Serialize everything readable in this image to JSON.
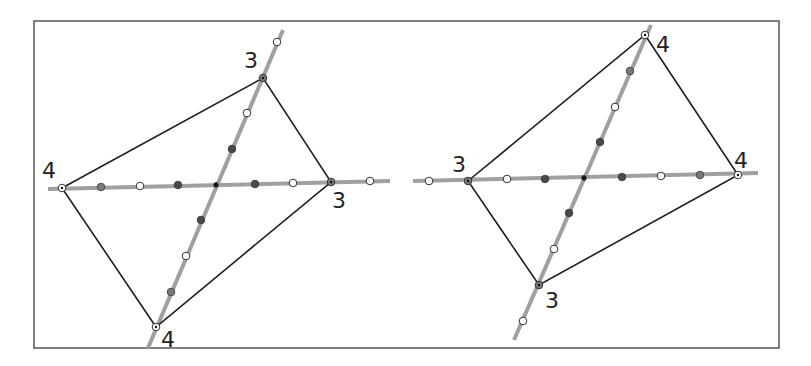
{
  "frame": {
    "x": 34,
    "y": 21,
    "width": 745,
    "height": 327,
    "stroke": "#555555"
  },
  "colors": {
    "axis_line": "#a0a0a0",
    "edge": "#1e1e1e",
    "dot_dark": "#4a4a4a",
    "dot_mid": "#7a7a7a",
    "dot_white": "#ffffff",
    "dot_center": "#111111",
    "dot_stroke": "#333333"
  },
  "figures": [
    {
      "name": "left-figure",
      "axes": [
        {
          "x1": 48,
          "y1": 189,
          "x2": 390,
          "y2": 181
        },
        {
          "x1": 148,
          "y1": 348,
          "x2": 283,
          "y2": 30
        }
      ],
      "quad": [
        [
          62,
          188
        ],
        [
          263,
          78
        ],
        [
          331,
          182
        ],
        [
          156,
          327
        ]
      ],
      "vertices": [
        {
          "x": 62,
          "y": 188,
          "label": "4",
          "lx": 42,
          "ly": 178,
          "type": "ring"
        },
        {
          "x": 263,
          "y": 78,
          "label": "3",
          "lx": 244,
          "ly": 68,
          "type": "dark"
        },
        {
          "x": 331,
          "y": 182,
          "label": "3",
          "lx": 332,
          "ly": 208,
          "type": "dark"
        },
        {
          "x": 156,
          "y": 327,
          "label": "4",
          "lx": 161,
          "ly": 347,
          "type": "ring"
        }
      ],
      "dots": [
        {
          "x": 101,
          "y": 187,
          "type": "mid"
        },
        {
          "x": 140,
          "y": 186,
          "type": "white"
        },
        {
          "x": 178,
          "y": 185,
          "type": "dark"
        },
        {
          "x": 216,
          "y": 185,
          "type": "center"
        },
        {
          "x": 255,
          "y": 184,
          "type": "dark"
        },
        {
          "x": 293,
          "y": 183,
          "type": "white"
        },
        {
          "x": 370,
          "y": 181,
          "type": "white"
        },
        {
          "x": 277,
          "y": 42,
          "type": "white"
        },
        {
          "x": 247,
          "y": 113,
          "type": "white"
        },
        {
          "x": 232,
          "y": 149,
          "type": "dark"
        },
        {
          "x": 201,
          "y": 220,
          "type": "dark"
        },
        {
          "x": 186,
          "y": 256,
          "type": "white"
        },
        {
          "x": 171,
          "y": 292,
          "type": "mid"
        }
      ]
    },
    {
      "name": "right-figure",
      "axes": [
        {
          "x1": 413,
          "y1": 181,
          "x2": 758,
          "y2": 173
        },
        {
          "x1": 514,
          "y1": 340,
          "x2": 651,
          "y2": 25
        }
      ],
      "quad": [
        [
          468,
          181
        ],
        [
          645,
          35
        ],
        [
          738,
          175
        ],
        [
          539,
          285
        ]
      ],
      "vertices": [
        {
          "x": 468,
          "y": 181,
          "label": "3",
          "lx": 452,
          "ly": 172,
          "type": "dark"
        },
        {
          "x": 645,
          "y": 35,
          "label": "4",
          "lx": 656,
          "ly": 52,
          "type": "ring"
        },
        {
          "x": 738,
          "y": 175,
          "label": "4",
          "lx": 734,
          "ly": 168,
          "type": "ring"
        },
        {
          "x": 539,
          "y": 285,
          "label": "3",
          "lx": 545,
          "ly": 308,
          "type": "dark"
        }
      ],
      "dots": [
        {
          "x": 429,
          "y": 181,
          "type": "white"
        },
        {
          "x": 507,
          "y": 179,
          "type": "white"
        },
        {
          "x": 545,
          "y": 179,
          "type": "dark"
        },
        {
          "x": 584,
          "y": 178,
          "type": "center"
        },
        {
          "x": 622,
          "y": 177,
          "type": "dark"
        },
        {
          "x": 661,
          "y": 176,
          "type": "white"
        },
        {
          "x": 700,
          "y": 175,
          "type": "mid"
        },
        {
          "x": 630,
          "y": 71,
          "type": "mid"
        },
        {
          "x": 615,
          "y": 107,
          "type": "white"
        },
        {
          "x": 600,
          "y": 142,
          "type": "dark"
        },
        {
          "x": 569,
          "y": 213,
          "type": "dark"
        },
        {
          "x": 554,
          "y": 249,
          "type": "white"
        },
        {
          "x": 523,
          "y": 321,
          "type": "white"
        }
      ]
    }
  ],
  "labels": {
    "left_v1": "4",
    "left_v2": "3",
    "left_v3": "3",
    "left_v4": "4",
    "right_v1": "3",
    "right_v2": "4",
    "right_v3": "4",
    "right_v4": "3"
  }
}
